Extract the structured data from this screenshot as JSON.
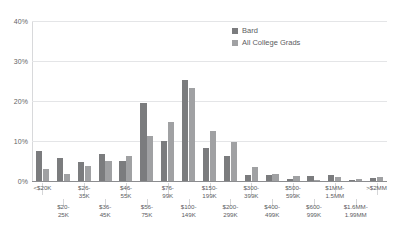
{
  "chart_data": {
    "type": "bar",
    "title": "",
    "subtitle": "",
    "xlabel": "",
    "ylabel": "",
    "ylim": [
      0,
      40
    ],
    "ytick_labels": [
      "0%",
      "10%",
      "20%",
      "30%",
      "40%"
    ],
    "ytick_values": [
      0,
      10,
      20,
      30,
      40
    ],
    "grid": true,
    "legend_position": "top-right",
    "categories": [
      "<$20K",
      "$20-25K",
      "$26-35K",
      "$36-45K",
      "$46-55K",
      "$56-75K",
      "$76-99K",
      "$100-149K",
      "$150-199K",
      "$200-299K",
      "$300-399K",
      "$400-499K",
      "$500-599K",
      "$600-999K",
      "$1MM-1.5MM",
      "$1.6MM-1.99MM",
      ">$2MM"
    ],
    "series": [
      {
        "name": "Bard",
        "color": "#7b7c7e",
        "values": [
          7.6,
          5.8,
          4.8,
          6.7,
          5.0,
          19.4,
          9.9,
          25.3,
          8.3,
          6.3,
          1.5,
          1.6,
          0.4,
          1.3,
          1.4,
          0.3,
          0.8
        ]
      },
      {
        "name": "All College Grads",
        "color": "#a0a1a3",
        "values": [
          3.0,
          1.8,
          3.7,
          5.1,
          6.2,
          11.3,
          14.8,
          23.2,
          12.5,
          9.8,
          3.4,
          1.7,
          1.3,
          0.3,
          1.0,
          0.4,
          0.9
        ]
      }
    ]
  },
  "legend": {
    "items": [
      {
        "label": "Bard"
      },
      {
        "label": "All College Grads"
      }
    ]
  }
}
